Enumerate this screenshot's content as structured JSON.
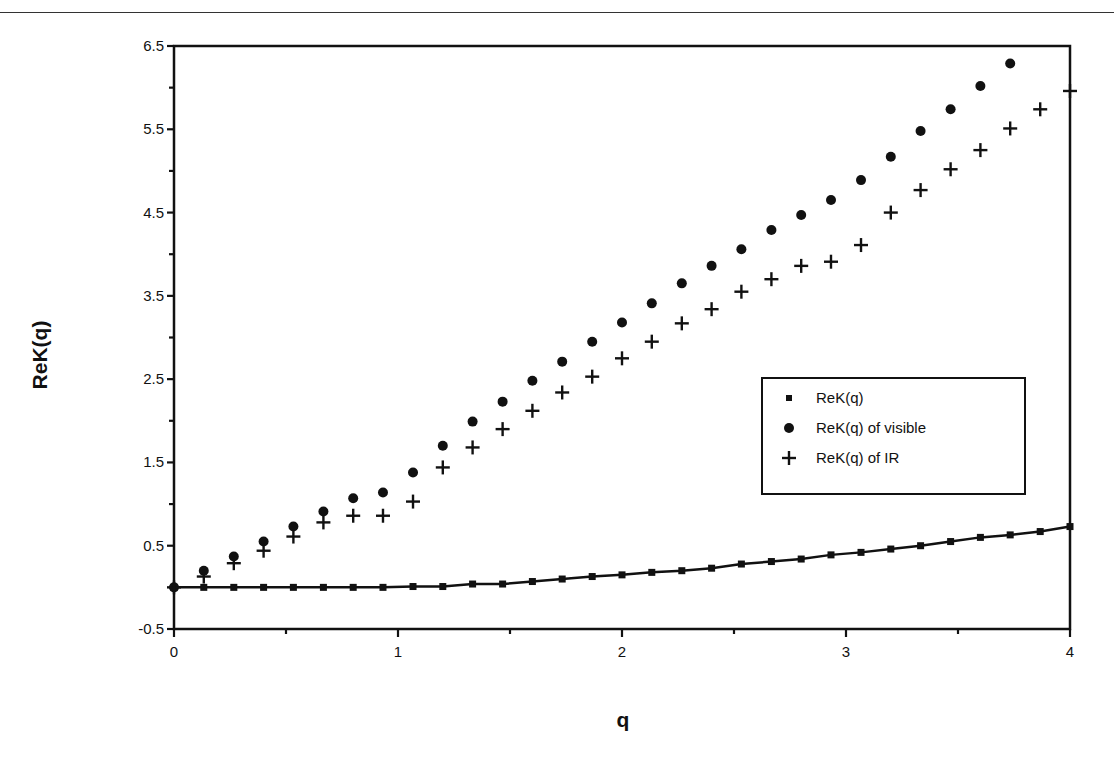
{
  "chart_data": {
    "type": "scatter",
    "title": "",
    "xlabel": "q",
    "ylabel": "ReK(q)",
    "xlim": [
      0,
      4
    ],
    "ylim": [
      -0.5,
      6.5
    ],
    "x_ticks": [
      0,
      1,
      2,
      3,
      4
    ],
    "x_tick_labels": [
      "0",
      "1",
      "2",
      "3",
      "4"
    ],
    "y_ticks": [
      -0.5,
      0.5,
      1.5,
      2.5,
      3.5,
      4.5,
      5.5,
      6.5
    ],
    "y_tick_labels": [
      "-0.5",
      "0.5",
      "1.5",
      "2.5",
      "3.5",
      "4.5",
      "5.5",
      "6.5"
    ],
    "grid": false,
    "legend_position": "center-right",
    "x": [
      0,
      0.133,
      0.267,
      0.4,
      0.533,
      0.667,
      0.8,
      0.933,
      1.067,
      1.2,
      1.333,
      1.467,
      1.6,
      1.733,
      1.867,
      2.0,
      2.133,
      2.267,
      2.4,
      2.533,
      2.667,
      2.8,
      2.933,
      3.067,
      3.2,
      3.333,
      3.467,
      3.6,
      3.733,
      3.867,
      4.0
    ],
    "series": [
      {
        "name": "ReK(q)",
        "marker": "square",
        "line": true,
        "values": [
          0.0,
          0.0,
          0.0,
          0.0,
          0.0,
          0.0,
          0.0,
          0.0,
          0.01,
          0.01,
          0.04,
          0.04,
          0.07,
          0.1,
          0.13,
          0.15,
          0.18,
          0.2,
          0.23,
          0.28,
          0.31,
          0.34,
          0.39,
          0.42,
          0.46,
          0.5,
          0.55,
          0.6,
          0.63,
          0.67,
          0.73
        ]
      },
      {
        "name": "ReK(q) of visible",
        "marker": "circle",
        "line": false,
        "values": [
          0.0,
          0.2,
          0.37,
          0.55,
          0.73,
          0.91,
          1.07,
          1.14,
          1.38,
          1.7,
          1.99,
          2.23,
          2.48,
          2.71,
          2.95,
          3.18,
          3.41,
          3.65,
          3.86,
          4.06,
          4.29,
          4.47,
          4.65,
          4.89,
          5.17,
          5.48,
          5.74,
          6.02,
          6.29,
          null,
          null
        ]
      },
      {
        "name": "ReK(q) of IR",
        "marker": "plus",
        "line": false,
        "values": [
          0.0,
          0.13,
          0.29,
          0.44,
          0.61,
          0.78,
          0.86,
          0.86,
          1.03,
          1.44,
          1.68,
          1.9,
          2.12,
          2.34,
          2.53,
          2.75,
          2.95,
          3.17,
          3.34,
          3.55,
          3.7,
          3.86,
          3.91,
          4.11,
          4.5,
          4.77,
          5.02,
          5.25,
          5.51,
          5.74,
          5.96
        ]
      }
    ],
    "legend": [
      {
        "label": "ReK(q)",
        "marker": "square"
      },
      {
        "label": "ReK(q) of visible",
        "marker": "circle"
      },
      {
        "label": "ReK(q) of IR",
        "marker": "plus"
      }
    ]
  },
  "colors": {
    "ink": "#111111",
    "background": "#ffffff"
  }
}
